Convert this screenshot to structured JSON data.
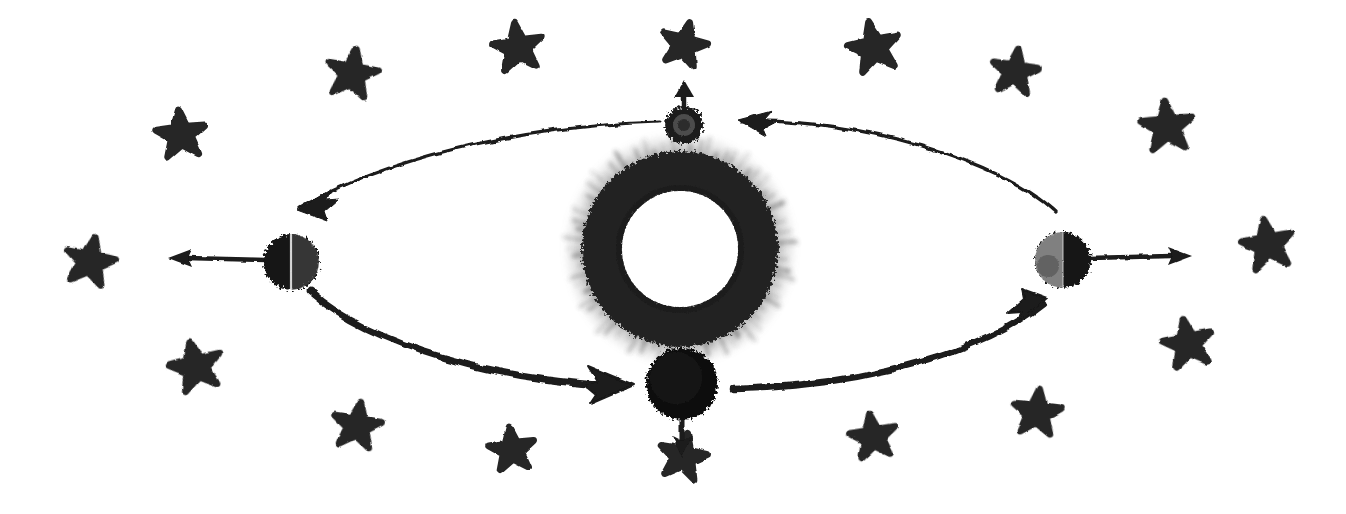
{
  "figure": {
    "name": "moon-phases-orbit-diagram",
    "style": "hand-drawn charcoal sketch",
    "background_color": "#ffffff",
    "ink_color": "#1a1a1a",
    "width": 1346,
    "height": 514
  },
  "sun": {
    "label": "sun",
    "center": [
      680,
      249
    ],
    "outer_radius": 118,
    "ring_outer_radius": 98,
    "ring_inner_radius": 58,
    "core_color": "#ffffff",
    "ring_color": "#2b2b2b",
    "halo_color": "#777777",
    "description": "rough charcoal annulus with fuzzy radial strokes and a hollow white core"
  },
  "orbit": {
    "label": "orbit-ellipse",
    "center": [
      680,
      250
    ],
    "radius_x": 390,
    "radius_y": 137,
    "direction": "counter-clockwise",
    "arc_segments": [
      {
        "name": "arc-top-right",
        "from": [
          1055,
          212
        ],
        "to": [
          742,
          121
        ],
        "arrowhead": "left",
        "weight": "thin"
      },
      {
        "name": "arc-top-left",
        "from": [
          660,
          122
        ],
        "to": [
          300,
          208
        ],
        "arrowhead": "down-left",
        "weight": "thin"
      },
      {
        "name": "arc-bottom-left",
        "from": [
          310,
          292
        ],
        "to": [
          623,
          386
        ],
        "arrowhead": "right",
        "weight": "thick"
      },
      {
        "name": "arc-bottom-right",
        "from": [
          735,
          389
        ],
        "to": [
          1043,
          303
        ],
        "arrowhead": "up-right",
        "weight": "thick"
      }
    ]
  },
  "moons": [
    {
      "name": "moon-top",
      "phase": "new-moon",
      "position_label": "top",
      "center": [
        684,
        125
      ],
      "radius": 19,
      "lit_side": "far-side",
      "fill": "dark-ring-light-core",
      "arrow": {
        "name": "moon-top-arrow",
        "direction": "up",
        "from": [
          684,
          108
        ],
        "to": [
          684,
          82
        ]
      }
    },
    {
      "name": "moon-left",
      "phase": "third-quarter",
      "position_label": "left",
      "center": [
        291,
        262
      ],
      "radius": 28,
      "lit_side": "right",
      "fill": "half-dark-half-shaded",
      "arrow": {
        "name": "moon-left-arrow",
        "direction": "left",
        "from": [
          263,
          260
        ],
        "to": [
          170,
          258
        ]
      }
    },
    {
      "name": "moon-bottom",
      "phase": "full-moon",
      "position_label": "bottom",
      "center": [
        682,
        384
      ],
      "radius": 36,
      "lit_side": "near-side",
      "fill": "solid-dark",
      "arrow": {
        "name": "moon-bottom-arrow",
        "direction": "down",
        "from": [
          682,
          414
        ],
        "to": [
          682,
          460
        ]
      }
    },
    {
      "name": "moon-right",
      "phase": "first-quarter",
      "position_label": "right",
      "center": [
        1063,
        260
      ],
      "radius": 28,
      "lit_side": "left",
      "fill": "light-left-dark-right",
      "arrow": {
        "name": "moon-right-arrow",
        "direction": "right",
        "from": [
          1091,
          258
        ],
        "to": [
          1193,
          256
        ]
      }
    }
  ],
  "stars": [
    {
      "name": "star-1",
      "cx": 181,
      "cy": 135,
      "r": 25,
      "rot": -6
    },
    {
      "name": "star-2",
      "cx": 352,
      "cy": 74,
      "r": 25,
      "rot": 10
    },
    {
      "name": "star-3",
      "cx": 518,
      "cy": 48,
      "r": 25,
      "rot": -8
    },
    {
      "name": "star-4",
      "cx": 684,
      "cy": 45,
      "r": 23,
      "rot": 14
    },
    {
      "name": "star-5",
      "cx": 874,
      "cy": 48,
      "r": 26,
      "rot": -12
    },
    {
      "name": "star-6",
      "cx": 1015,
      "cy": 72,
      "r": 23,
      "rot": 8
    },
    {
      "name": "star-7",
      "cx": 1167,
      "cy": 127,
      "r": 26,
      "rot": -5
    },
    {
      "name": "star-8",
      "cx": 90,
      "cy": 262,
      "r": 25,
      "rot": 12
    },
    {
      "name": "star-9",
      "cx": 1268,
      "cy": 245,
      "r": 26,
      "rot": -10
    },
    {
      "name": "star-10",
      "cx": 196,
      "cy": 367,
      "r": 26,
      "rot": -14
    },
    {
      "name": "star-11",
      "cx": 357,
      "cy": 426,
      "r": 24,
      "rot": 9
    },
    {
      "name": "star-12",
      "cx": 512,
      "cy": 450,
      "r": 23,
      "rot": -7
    },
    {
      "name": "star-13",
      "cx": 683,
      "cy": 457,
      "r": 24,
      "rot": 11
    },
    {
      "name": "star-14",
      "cx": 873,
      "cy": 437,
      "r": 23,
      "rot": -9
    },
    {
      "name": "star-15",
      "cx": 1037,
      "cy": 413,
      "r": 24,
      "rot": 6
    },
    {
      "name": "star-16",
      "cx": 1188,
      "cy": 344,
      "r": 25,
      "rot": -11
    }
  ]
}
